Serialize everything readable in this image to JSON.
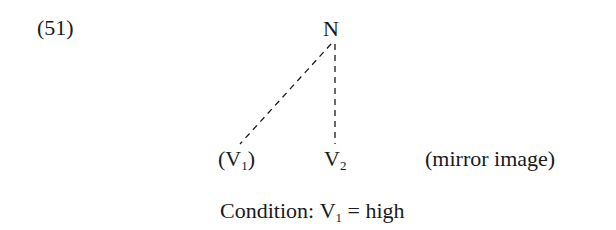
{
  "example_number": "(51)",
  "tree": {
    "root": "N",
    "leaves": [
      {
        "label": "V",
        "subscript": "1",
        "parenthesized": true
      },
      {
        "label": "V",
        "subscript": "2",
        "parenthesized": false
      }
    ],
    "edges": [
      {
        "from": "N",
        "to": "V1",
        "style": "dashed"
      },
      {
        "from": "N",
        "to": "V2",
        "style": "dashed"
      }
    ]
  },
  "annotation": "(mirror image)",
  "condition": {
    "prefix": "Condition:",
    "var": "V",
    "subscript": "1",
    "eq": "=",
    "value": "high"
  },
  "paren_open": "(",
  "paren_close": ")"
}
